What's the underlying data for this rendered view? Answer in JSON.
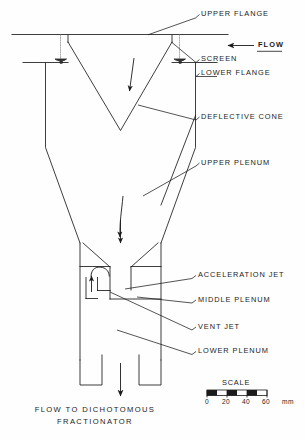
{
  "figure": {
    "type": "engineering-cross-section-diagram"
  },
  "labels": {
    "upper_flange": "UPPER FLANGE",
    "flow": "FLOW",
    "screen": "SCREEN",
    "lower_flange": "LOWER FLANGE",
    "deflective_cone": "DEFLECTIVE CONE",
    "upper_plenum": "UPPER PLENUM",
    "acceleration_jet": "ACCELERATION JET",
    "middle_plenum": "MIDDLE PLENUM",
    "vent_jet": "VENT JET",
    "lower_plenum": "LOWER PLENUM"
  },
  "caption": {
    "line1": "FLOW TO DICHOTOMOUS",
    "line2": "FRACTIONATOR"
  },
  "scale": {
    "title": "SCALE",
    "ticks": [
      "0",
      "20",
      "40",
      "60"
    ],
    "unit": "mm",
    "min": 0,
    "max": 60,
    "segment_step": 10
  },
  "colors": {
    "line": "#1b1b1b",
    "background": "#fefefe",
    "hidden_line": "#7d7d7d"
  }
}
